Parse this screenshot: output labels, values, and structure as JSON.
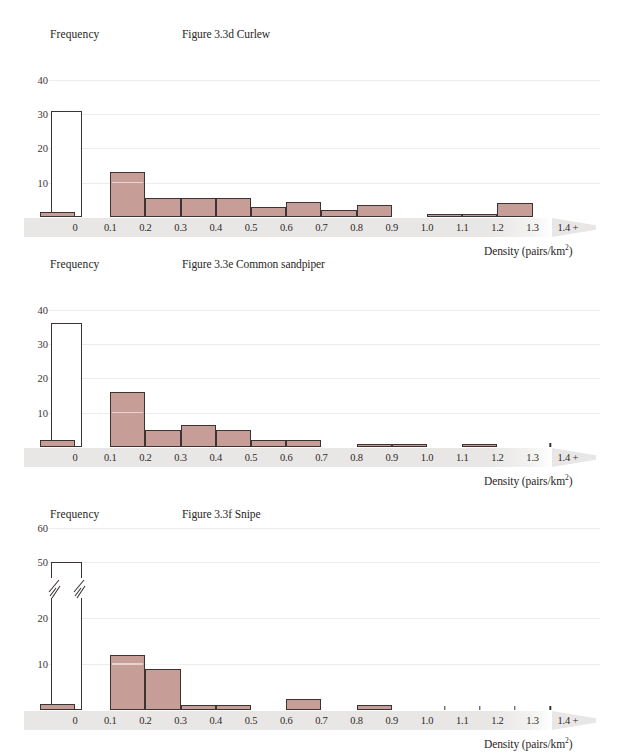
{
  "page": {
    "width": 618,
    "height": 755,
    "background": "#ffffff",
    "bar_fill": "#c79d98",
    "bar_stroke": "#3c3432",
    "band_color": "#e9e7e6",
    "gridline_color": "#efecec"
  },
  "common": {
    "y_axis_title": "Frequency",
    "x_axis_title_text": "Density (pairs/km",
    "x_axis_title_sup": "2",
    "x_axis_title_tail": ")"
  },
  "chart_data": [
    {
      "id": "curlew",
      "type": "bar",
      "title": "Figure 3.3d Curlew",
      "ylabel": "Frequency",
      "xlabel": "Density (pairs/km²)",
      "ylim": [
        0,
        44
      ],
      "yticks": [
        10,
        20,
        30,
        40
      ],
      "grid": true,
      "legend": "none",
      "axis_break": false,
      "xticks": [
        "0",
        "0.1",
        "0.2",
        "0.3",
        "0.4",
        "0.5",
        "0.6",
        "0.7",
        "0.8",
        "0.9",
        "1.0",
        "1.1",
        "1.2",
        "1.3",
        "1.4 +"
      ],
      "zero_bin": {
        "label": "0",
        "value": 31,
        "style": "hollow"
      },
      "bins": [
        {
          "from": "0.1",
          "to": "0.2",
          "value": 13
        },
        {
          "from": "0.2",
          "to": "0.3",
          "value": 5.5
        },
        {
          "from": "0.3",
          "to": "0.4",
          "value": 5.5
        },
        {
          "from": "0.4",
          "to": "0.5",
          "value": 5.5
        },
        {
          "from": "0.5",
          "to": "0.6",
          "value": 3
        },
        {
          "from": "0.6",
          "to": "0.7",
          "value": 4.5
        },
        {
          "from": "0.7",
          "to": "0.8",
          "value": 2
        },
        {
          "from": "0.8",
          "to": "0.9",
          "value": 3.5
        },
        {
          "from": "1.0",
          "to": "1.1",
          "value": 1
        },
        {
          "from": "1.1",
          "to": "1.2",
          "value": 1
        },
        {
          "from": "1.2",
          "to": "1.3",
          "value": 4
        },
        {
          "from": "1.4",
          "to": "1.5",
          "value": 1.5
        }
      ],
      "pips": []
    },
    {
      "id": "common-sandpiper",
      "type": "bar",
      "title": "Figure 3.3e Common sandpiper",
      "ylabel": "Frequency",
      "xlabel": "Density (pairs/km²)",
      "ylim": [
        0,
        44
      ],
      "yticks": [
        10,
        20,
        30,
        40
      ],
      "grid": true,
      "legend": "none",
      "axis_break": false,
      "xticks": [
        "0",
        "0.1",
        "0.2",
        "0.3",
        "0.4",
        "0.5",
        "0.6",
        "0.7",
        "0.8",
        "0.9",
        "1.0",
        "1.1",
        "1.2",
        "1.3",
        "1.4 +"
      ],
      "zero_bin": {
        "label": "0",
        "value": 36,
        "style": "hollow"
      },
      "bins": [
        {
          "from": "0.1",
          "to": "0.2",
          "value": 16
        },
        {
          "from": "0.2",
          "to": "0.3",
          "value": 5
        },
        {
          "from": "0.3",
          "to": "0.4",
          "value": 6.5
        },
        {
          "from": "0.4",
          "to": "0.5",
          "value": 5
        },
        {
          "from": "0.5",
          "to": "0.6",
          "value": 2
        },
        {
          "from": "0.6",
          "to": "0.7",
          "value": 2
        },
        {
          "from": "0.8",
          "to": "0.9",
          "value": 1
        },
        {
          "from": "0.9",
          "to": "1.0",
          "value": 1
        },
        {
          "from": "1.1",
          "to": "1.2",
          "value": 1
        },
        {
          "from": "1.4",
          "to": "1.5",
          "value": 2
        }
      ],
      "pips": [
        "1.3"
      ]
    },
    {
      "id": "snipe",
      "type": "bar",
      "title": "Figure 3.3f Snipe",
      "ylabel": "Frequency",
      "xlabel": "Density (pairs/km²)",
      "ylim": [
        0,
        66
      ],
      "yticks": [
        10,
        20,
        50,
        60
      ],
      "grid": true,
      "legend": "none",
      "axis_break": true,
      "axis_break_note": "y-axis broken between 20 and 50",
      "xticks": [
        "0",
        "0.1",
        "0.2",
        "0.3",
        "0.4",
        "0.5",
        "0.6",
        "0.7",
        "0.8",
        "0.9",
        "1.0",
        "1.1",
        "1.2",
        "1.3",
        "1.4 +"
      ],
      "zero_bin": {
        "label": "0",
        "value": 50,
        "style": "hollow"
      },
      "bins": [
        {
          "from": "0.1",
          "to": "0.2",
          "value": 12
        },
        {
          "from": "0.2",
          "to": "0.3",
          "value": 9
        },
        {
          "from": "0.3",
          "to": "0.4",
          "value": 1
        },
        {
          "from": "0.4",
          "to": "0.5",
          "value": 1
        },
        {
          "from": "0.6",
          "to": "0.7",
          "value": 2.5
        },
        {
          "from": "0.8",
          "to": "0.9",
          "value": 1
        },
        {
          "from": "1.4",
          "to": "1.5",
          "value": 1.2
        }
      ],
      "pips": [
        "1.0",
        "1.1",
        "1.2",
        "1.3"
      ]
    }
  ]
}
